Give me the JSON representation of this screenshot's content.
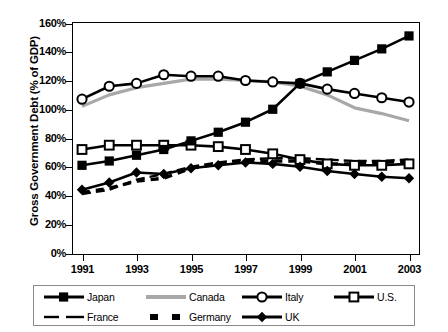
{
  "chart_data": {
    "type": "line",
    "title": "",
    "xlabel": "",
    "ylabel": "Gross Government Debt (% of GDP)",
    "x": [
      1991,
      1992,
      1993,
      1994,
      1995,
      1996,
      1997,
      1998,
      1999,
      2000,
      2001,
      2002,
      2003
    ],
    "xtick_labels": [
      "1991",
      "1993",
      "1995",
      "1997",
      "1999",
      "2001",
      "2003"
    ],
    "xtick_values": [
      1991,
      1993,
      1995,
      1997,
      1999,
      2001,
      2003
    ],
    "ytick_labels": [
      "0%",
      "20%",
      "40%",
      "60%",
      "80%",
      "100%",
      "120%",
      "140%",
      "160%"
    ],
    "ytick_values": [
      0,
      20,
      40,
      60,
      80,
      100,
      120,
      140,
      160
    ],
    "ylim": [
      0,
      160
    ],
    "xlim": [
      1991,
      2003
    ],
    "grid": false,
    "legend_position": "bottom",
    "series": [
      {
        "name": "Japan",
        "marker": "filled-square",
        "line": "solid",
        "color": "#000000",
        "values": [
          61,
          64,
          68,
          72,
          78,
          84,
          91,
          100,
          118,
          126,
          134,
          142,
          151
        ]
      },
      {
        "name": "Canada",
        "marker": "none",
        "line": "solid",
        "color": "#a8a8a8",
        "values": [
          102,
          110,
          115,
          118,
          121,
          121,
          120,
          119,
          116,
          110,
          101,
          97,
          92
        ]
      },
      {
        "name": "Italy",
        "marker": "open-circle",
        "line": "solid",
        "color": "#000000",
        "values": [
          107,
          116,
          118,
          124,
          123,
          123,
          120,
          119,
          118,
          114,
          111,
          108,
          105
        ]
      },
      {
        "name": "U.S.",
        "marker": "open-square",
        "line": "solid",
        "color": "#000000",
        "values": [
          72,
          75,
          75,
          75,
          75,
          74,
          72,
          69,
          65,
          62,
          61,
          61,
          62
        ]
      },
      {
        "name": "France",
        "marker": "none",
        "line": "dashed",
        "color": "#000000",
        "values": [
          41,
          44,
          51,
          55,
          60,
          63,
          65,
          66,
          66,
          65,
          64,
          64,
          65
        ]
      },
      {
        "name": "Germany",
        "marker": "none",
        "line": "dashed-square",
        "color": "#000000",
        "values": [
          42,
          45,
          50,
          52,
          59,
          62,
          64,
          64,
          64,
          62,
          62,
          63,
          64
        ]
      },
      {
        "name": "UK",
        "marker": "filled-diamond",
        "line": "solid",
        "color": "#000000",
        "values": [
          44,
          49,
          56,
          55,
          59,
          61,
          63,
          62,
          60,
          57,
          55,
          53,
          52
        ]
      }
    ]
  },
  "axis": {
    "y_title": "Gross Government Debt (% of GDP)"
  },
  "legend": {
    "items": [
      {
        "label": "Japan",
        "key": "filled-square-line"
      },
      {
        "label": "Canada",
        "key": "gray-line"
      },
      {
        "label": "Italy",
        "key": "open-circle-line"
      },
      {
        "label": "U.S.",
        "key": "open-square-line"
      },
      {
        "label": "France",
        "key": "dashed-line"
      },
      {
        "label": "Germany",
        "key": "dashed-square-line"
      },
      {
        "label": "UK",
        "key": "filled-diamond-line"
      }
    ]
  }
}
